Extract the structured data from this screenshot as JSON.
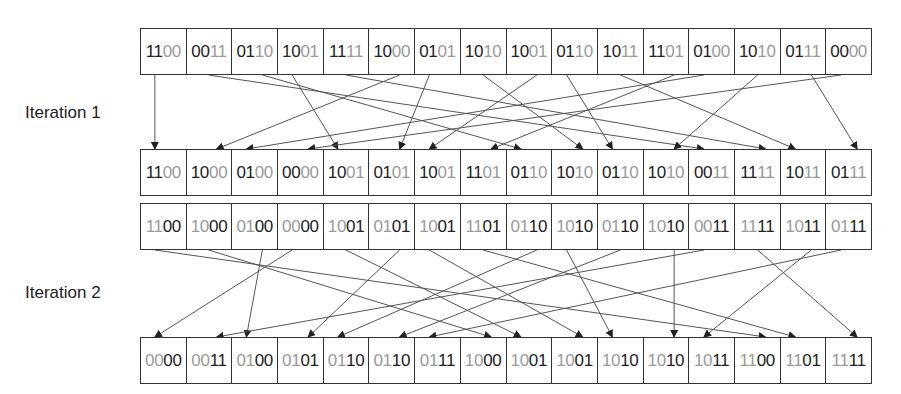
{
  "labels": {
    "iteration1": "Iteration 1",
    "iteration2": "Iteration 2"
  },
  "colors": {
    "highlight_digit": "#9a9a9a",
    "normal_digit": "#222222",
    "line": "#555555"
  },
  "rows": {
    "input": [
      "1100",
      "0011",
      "0110",
      "1001",
      "1111",
      "1000",
      "0101",
      "1010",
      "1001",
      "0110",
      "1011",
      "1101",
      "0100",
      "1010",
      "0111",
      "0000"
    ],
    "after_iteration1": [
      "1100",
      "1000",
      "0100",
      "0000",
      "1001",
      "0101",
      "1001",
      "1101",
      "0110",
      "1010",
      "0110",
      "1010",
      "0011",
      "1111",
      "1011",
      "0111"
    ],
    "iteration2_input": [
      "1100",
      "1000",
      "0100",
      "0000",
      "1001",
      "0101",
      "1001",
      "1101",
      "0110",
      "1010",
      "0110",
      "1010",
      "0011",
      "1111",
      "1011",
      "0111"
    ],
    "output": [
      "0000",
      "0011",
      "0100",
      "0101",
      "0110",
      "0110",
      "0111",
      "1000",
      "1001",
      "1001",
      "1010",
      "1010",
      "1011",
      "1100",
      "1101",
      "1111"
    ]
  },
  "highlight": {
    "input": "last2",
    "after_iteration1": "last2",
    "iteration2_input": "first2",
    "output": "first2"
  },
  "geometry": {
    "left": 140,
    "width": 732,
    "cells": 16,
    "row_tops": {
      "input": 28,
      "after_iteration1": 149,
      "iteration2_input": 203,
      "output": 337
    },
    "row_height": 47
  }
}
